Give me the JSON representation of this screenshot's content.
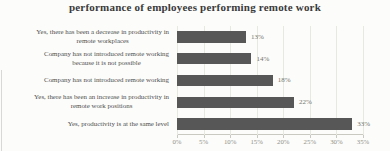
{
  "chart_data": {
    "type": "bar",
    "orientation": "horizontal",
    "title": "performance of employees performing remote work",
    "categories": [
      "Yes, there has been a decrease in productivity in\nremote workplaces",
      "Company has not introduced remote working\nbecause it is not possible",
      "Company has not introduced remote working",
      "Yes, there has been an increase in productivity in\nremote work positions",
      "Yes, productivity is at the same level"
    ],
    "values": [
      13,
      14,
      18,
      22,
      33
    ],
    "value_labels": [
      "13%",
      "14%",
      "18%",
      "22%",
      "33%"
    ],
    "x_ticks": [
      "0%",
      "5%",
      "10%",
      "15%",
      "20%",
      "25%",
      "30%",
      "35%"
    ],
    "xlim": [
      0,
      35
    ],
    "grid": "vertical",
    "legend": "none",
    "colors": {
      "bar": "#575757",
      "title": "#3a3a3a",
      "category_label": "#4e4e4e",
      "value_label": "#74746c",
      "tick_label": "#8f8f87",
      "gridline": "#e8e8e3",
      "axis_line": "#c9c9c1",
      "background": "#fcfcfa"
    }
  }
}
